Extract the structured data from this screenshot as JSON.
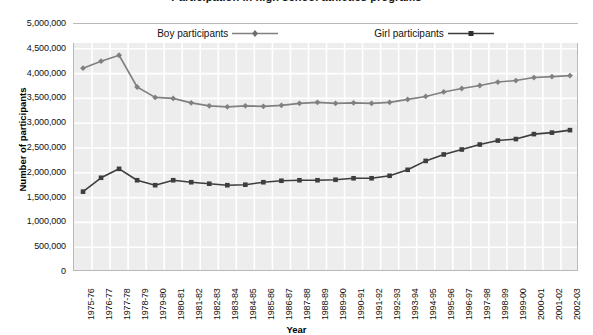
{
  "chart_data": {
    "type": "line",
    "title": "Participation in high school athletics programs",
    "xlabel": "Year",
    "ylabel": "Number of participants",
    "ylim": [
      0,
      5000000
    ],
    "ytick_step": 500000,
    "ytick_labels": [
      "5,000,000",
      "4,500,000",
      "4,000,000",
      "3,500,000",
      "3,000,000",
      "2,500,000",
      "2,000,000",
      "1,500,000",
      "1,000,000",
      "500,000",
      "0"
    ],
    "ytick_values": [
      5000000,
      4500000,
      4000000,
      3500000,
      3000000,
      2500000,
      2000000,
      1500000,
      1000000,
      500000,
      0
    ],
    "grid": true,
    "legend_position": "top-center-inside",
    "categories": [
      "1975-76",
      "1976-77",
      "1977-78",
      "1978-79",
      "1979-80",
      "1980-81",
      "1981-82",
      "1982-83",
      "1983-84",
      "1984-85",
      "1985-86",
      "1986-87",
      "1987-88",
      "1988-89",
      "1989-90",
      "1990-91",
      "1991-92",
      "1992-93",
      "1993-94",
      "1994-95",
      "1995-96",
      "1996-97",
      "1997-98",
      "1998-99",
      "1999-00",
      "2000-01",
      "2001-02",
      "2002-03"
    ],
    "series": [
      {
        "name": "Boy participants",
        "marker": "diamond",
        "color": "#808080",
        "values": [
          4110000,
          4250000,
          4370000,
          3730000,
          3520000,
          3500000,
          3410000,
          3350000,
          3330000,
          3350000,
          3340000,
          3360000,
          3400000,
          3420000,
          3400000,
          3410000,
          3400000,
          3420000,
          3480000,
          3540000,
          3630000,
          3700000,
          3760000,
          3830000,
          3860000,
          3920000,
          3940000,
          3960000
        ]
      },
      {
        "name": "Girl participants",
        "marker": "square",
        "color": "#3d3d3d",
        "values": [
          1620000,
          1900000,
          2080000,
          1850000,
          1750000,
          1850000,
          1810000,
          1780000,
          1750000,
          1760000,
          1810000,
          1840000,
          1850000,
          1850000,
          1860000,
          1890000,
          1890000,
          1940000,
          2060000,
          2240000,
          2370000,
          2470000,
          2570000,
          2650000,
          2680000,
          2780000,
          2810000,
          2860000
        ]
      }
    ]
  },
  "legend": {
    "boy_label": "Boy participants",
    "girl_label": "Girl participants"
  }
}
